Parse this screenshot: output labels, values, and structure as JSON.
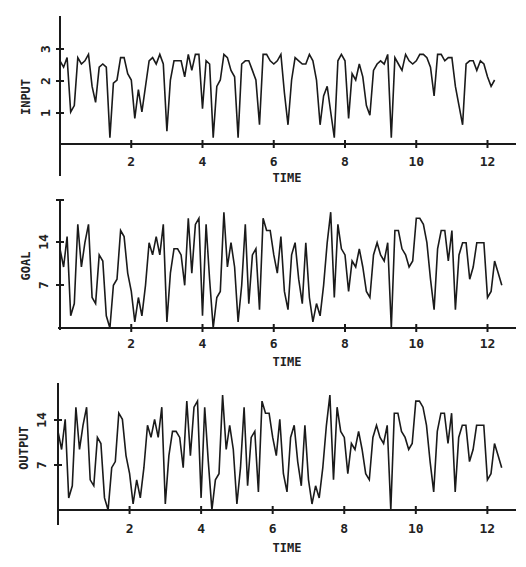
{
  "chart_data": [
    {
      "type": "line",
      "title": "",
      "xlabel": "TIME",
      "ylabel": "INPUT",
      "xticks": [
        2,
        4,
        6,
        8,
        10,
        12
      ],
      "yticks": [
        1,
        2,
        3
      ],
      "xlim": [
        0,
        12.8
      ],
      "ylim": [
        0,
        4
      ],
      "grid": false,
      "x": [
        0,
        0.1,
        0.2,
        0.3,
        0.4,
        0.5,
        0.6,
        0.7,
        0.8,
        0.9,
        1.0,
        1.1,
        1.2,
        1.3,
        1.4,
        1.5,
        1.6,
        1.7,
        1.8,
        1.9,
        2.0,
        2.1,
        2.2,
        2.3,
        2.4,
        2.5,
        2.6,
        2.7,
        2.8,
        2.9,
        3.0,
        3.1,
        3.2,
        3.3,
        3.4,
        3.5,
        3.6,
        3.7,
        3.8,
        3.9,
        4.0,
        4.1,
        4.2,
        4.3,
        4.4,
        4.5,
        4.6,
        4.7,
        4.8,
        4.9,
        5.0,
        5.1,
        5.2,
        5.3,
        5.4,
        5.5,
        5.6,
        5.7,
        5.8,
        5.9,
        6.0,
        6.1,
        6.2,
        6.3,
        6.4,
        6.5,
        6.6,
        6.7,
        6.8,
        6.9,
        7.0,
        7.1,
        7.2,
        7.3,
        7.4,
        7.5,
        7.6,
        7.7,
        7.8,
        7.9,
        8.0,
        8.1,
        8.2,
        8.3,
        8.4,
        8.5,
        8.6,
        8.7,
        8.8,
        8.9,
        9.0,
        9.1,
        9.2,
        9.3,
        9.4,
        9.5,
        9.6,
        9.7,
        9.8,
        9.9,
        10.0,
        10.1,
        10.2,
        10.3,
        10.4,
        10.5,
        10.6,
        10.7,
        10.8,
        10.9,
        11.0,
        11.1,
        11.2,
        11.3,
        11.4,
        11.5,
        11.6,
        11.7,
        11.8,
        11.9,
        12.0,
        12.1,
        12.2,
        12.3,
        12.4,
        12.5,
        12.6,
        12.7
      ],
      "values": [
        2.6,
        2.4,
        2.7,
        1.0,
        1.2,
        2.7,
        2.5,
        2.6,
        2.8,
        1.8,
        1.3,
        2.4,
        2.5,
        2.4,
        0.2,
        1.9,
        2.0,
        2.7,
        2.7,
        2.2,
        2.0,
        0.8,
        1.7,
        1.0,
        1.8,
        2.6,
        2.7,
        2.5,
        2.8,
        2.5,
        0.4,
        2.0,
        2.6,
        2.6,
        2.6,
        2.1,
        2.8,
        2.3,
        2.8,
        2.8,
        1.1,
        2.6,
        2.5,
        0.2,
        1.8,
        2.0,
        2.8,
        2.7,
        2.3,
        2.1,
        0.2,
        2.5,
        2.6,
        2.6,
        2.3,
        2.0,
        0.6,
        2.8,
        2.8,
        2.6,
        2.5,
        2.6,
        2.8,
        1.6,
        0.6,
        2.0,
        2.7,
        2.6,
        2.5,
        2.5,
        2.8,
        2.6,
        2.0,
        0.6,
        1.5,
        1.8,
        1.0,
        0.2,
        2.6,
        2.8,
        2.6,
        0.8,
        2.2,
        2.0,
        2.5,
        2.1,
        1.2,
        0.9,
        2.3,
        2.5,
        2.6,
        2.5,
        2.8,
        0.2,
        2.7,
        2.5,
        2.3,
        2.8,
        2.6,
        2.5,
        2.6,
        2.8,
        2.8,
        2.7,
        2.4,
        1.5,
        2.8,
        2.8,
        2.6,
        2.7,
        2.7,
        1.8,
        1.2,
        0.6,
        2.5,
        2.6,
        2.6,
        2.3,
        2.6,
        2.5,
        2.1,
        1.8,
        2.0
      ]
    },
    {
      "type": "line",
      "title": "",
      "xlabel": "TIME",
      "ylabel": "GOAL",
      "xticks": [
        2,
        4,
        6,
        8,
        10,
        12
      ],
      "yticks": [
        7,
        14
      ],
      "xlim": [
        0,
        12.8
      ],
      "ylim": [
        0,
        21
      ],
      "grid": false,
      "x": [
        0,
        0.1,
        0.2,
        0.3,
        0.4,
        0.5,
        0.6,
        0.7,
        0.8,
        0.9,
        1.0,
        1.1,
        1.2,
        1.3,
        1.4,
        1.5,
        1.6,
        1.7,
        1.8,
        1.9,
        2.0,
        2.1,
        2.2,
        2.3,
        2.4,
        2.5,
        2.6,
        2.7,
        2.8,
        2.9,
        3.0,
        3.1,
        3.2,
        3.3,
        3.4,
        3.5,
        3.6,
        3.7,
        3.8,
        3.9,
        4.0,
        4.1,
        4.2,
        4.3,
        4.4,
        4.5,
        4.6,
        4.7,
        4.8,
        4.9,
        5.0,
        5.1,
        5.2,
        5.3,
        5.4,
        5.5,
        5.6,
        5.7,
        5.8,
        5.9,
        6.0,
        6.1,
        6.2,
        6.3,
        6.4,
        6.5,
        6.6,
        6.7,
        6.8,
        6.9,
        7.0,
        7.1,
        7.2,
        7.3,
        7.4,
        7.5,
        7.6,
        7.7,
        7.8,
        7.9,
        8.0,
        8.1,
        8.2,
        8.3,
        8.4,
        8.5,
        8.6,
        8.7,
        8.8,
        8.9,
        9.0,
        9.1,
        9.2,
        9.3,
        9.4,
        9.5,
        9.6,
        9.7,
        9.8,
        9.9,
        10.0,
        10.1,
        10.2,
        10.3,
        10.4,
        10.5,
        10.6,
        10.7,
        10.8,
        10.9,
        11.0,
        11.1,
        11.2,
        11.3,
        11.4,
        11.5,
        11.6,
        11.7,
        11.8,
        11.9,
        12.0,
        12.1,
        12.2,
        12.3,
        12.4,
        12.5,
        12.6,
        12.7
      ],
      "values": [
        13,
        10,
        15,
        2,
        4,
        17,
        10,
        14,
        17,
        5,
        4,
        12,
        11,
        2,
        0,
        7,
        8,
        16,
        15,
        9,
        6,
        1,
        5,
        2,
        7,
        14,
        12,
        15,
        12,
        17,
        1,
        9,
        13,
        13,
        12,
        7,
        18,
        9,
        17,
        18,
        2,
        17,
        8,
        0,
        5,
        6,
        19,
        10,
        14,
        10,
        1,
        7,
        17,
        4,
        12,
        13,
        3,
        18,
        16,
        16,
        12,
        9,
        15,
        6,
        3,
        12,
        14,
        8,
        4,
        14,
        5,
        1,
        4,
        2,
        7,
        14,
        19,
        5,
        17,
        13,
        12,
        6,
        11,
        10,
        13,
        10,
        6,
        5,
        12,
        14,
        12,
        11,
        14,
        0,
        16,
        16,
        13,
        12,
        10,
        11,
        18,
        18,
        17,
        14,
        8,
        3,
        13,
        16,
        16,
        11,
        16,
        3,
        12,
        14,
        14,
        8,
        10,
        14,
        14,
        14,
        5,
        6,
        11,
        9,
        7
      ]
    },
    {
      "type": "line",
      "title": "",
      "xlabel": "TIME",
      "ylabel": "OUTPUT",
      "xticks": [
        2,
        4,
        6,
        8,
        10,
        12
      ],
      "yticks": [
        7,
        14
      ],
      "xlim": [
        0,
        12.8
      ],
      "ylim": [
        0,
        21
      ],
      "grid": false,
      "x": [
        0,
        0.1,
        0.2,
        0.3,
        0.4,
        0.5,
        0.6,
        0.7,
        0.8,
        0.9,
        1.0,
        1.1,
        1.2,
        1.3,
        1.4,
        1.5,
        1.6,
        1.7,
        1.8,
        1.9,
        2.0,
        2.1,
        2.2,
        2.3,
        2.4,
        2.5,
        2.6,
        2.7,
        2.8,
        2.9,
        3.0,
        3.1,
        3.2,
        3.3,
        3.4,
        3.5,
        3.6,
        3.7,
        3.8,
        3.9,
        4.0,
        4.1,
        4.2,
        4.3,
        4.4,
        4.5,
        4.6,
        4.7,
        4.8,
        4.9,
        5.0,
        5.1,
        5.2,
        5.3,
        5.4,
        5.5,
        5.6,
        5.7,
        5.8,
        5.9,
        6.0,
        6.1,
        6.2,
        6.3,
        6.4,
        6.5,
        6.6,
        6.7,
        6.8,
        6.9,
        7.0,
        7.1,
        7.2,
        7.3,
        7.4,
        7.5,
        7.6,
        7.7,
        7.8,
        7.9,
        8.0,
        8.1,
        8.2,
        8.3,
        8.4,
        8.5,
        8.6,
        8.7,
        8.8,
        8.9,
        9.0,
        9.1,
        9.2,
        9.3,
        9.4,
        9.5,
        9.6,
        9.7,
        9.8,
        9.9,
        10.0,
        10.1,
        10.2,
        10.3,
        10.4,
        10.5,
        10.6,
        10.7,
        10.8,
        10.9,
        11.0,
        11.1,
        11.2,
        11.3,
        11.4,
        11.5,
        11.6,
        11.7,
        11.8,
        11.9,
        12.0,
        12.1,
        12.2,
        12.3,
        12.4,
        12.5,
        12.6,
        12.7
      ],
      "values": [
        13,
        10,
        15,
        2,
        4,
        17,
        10,
        14,
        17,
        5,
        4,
        12,
        11,
        2,
        0,
        7,
        8,
        16,
        15,
        9,
        6,
        1,
        5,
        2,
        7,
        14,
        12,
        15,
        12,
        17,
        1,
        9,
        13,
        13,
        12,
        7,
        18,
        9,
        17,
        18,
        2,
        17,
        8,
        0,
        5,
        6,
        19,
        10,
        14,
        10,
        1,
        7,
        17,
        4,
        12,
        13,
        3,
        18,
        16,
        16,
        12,
        9,
        15,
        6,
        3,
        12,
        14,
        8,
        4,
        14,
        5,
        1,
        4,
        2,
        7,
        14,
        19,
        5,
        17,
        13,
        12,
        6,
        11,
        10,
        13,
        10,
        6,
        5,
        12,
        14,
        12,
        11,
        14,
        0,
        16,
        16,
        13,
        12,
        10,
        11,
        18,
        18,
        17,
        14,
        8,
        3,
        13,
        16,
        16,
        11,
        16,
        3,
        12,
        14,
        14,
        8,
        10,
        14,
        14,
        14,
        5,
        6,
        11,
        9,
        7
      ]
    }
  ],
  "panels": [
    {
      "ylabel": "INPUT",
      "xlabel": "TIME",
      "yticks": [
        "1",
        "2",
        "3"
      ],
      "xticks": [
        "2",
        "4",
        "6",
        "8",
        "10",
        "12"
      ]
    },
    {
      "ylabel": "GOAL",
      "xlabel": "TIME",
      "yticks": [
        "7",
        "14"
      ],
      "xticks": [
        "2",
        "4",
        "6",
        "8",
        "10",
        "12"
      ]
    },
    {
      "ylabel": "OUTPUT",
      "xlabel": "TIME",
      "yticks": [
        "7",
        "14"
      ],
      "xticks": [
        "2",
        "4",
        "6",
        "8",
        "10",
        "12"
      ]
    }
  ],
  "colors": {
    "line": "#1a1a1a",
    "axis": "#1a1a1a",
    "background": "#ffffff"
  }
}
